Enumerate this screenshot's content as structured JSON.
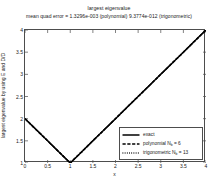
{
  "figure": {
    "title": "largest eigenvalue",
    "subtitle": "mean quad error = 1.3296e-003 (polynomial) 9.3774e-012 (trigonometric)",
    "xlabel": "x",
    "ylabel": "largest eigenvalue by using E and D/D"
  },
  "axes": {
    "xticks": [
      "0",
      "0.5",
      "1",
      "1.5",
      "2",
      "2.5",
      "3",
      "3.5",
      "4"
    ],
    "yticks": [
      "1",
      "1.5",
      "2",
      "2.5",
      "3",
      "3.5",
      "4"
    ]
  },
  "legend": {
    "items": [
      {
        "label": "exact",
        "label_sub": "",
        "label_tail": "",
        "style": "solid"
      },
      {
        "label": "polynomial N",
        "label_sub": "b",
        "label_tail": " = 6",
        "style": "dashed"
      },
      {
        "label": "trigonometric N",
        "label_sub": "b",
        "label_tail": " = 13",
        "style": "dotted"
      }
    ]
  },
  "chart_data": {
    "type": "line",
    "title": "largest eigenvalue",
    "subtitle": "mean quad error = 1.3296e-003 (polynomial) 9.3774e-012 (trigonometric)",
    "xlabel": "x",
    "ylabel": "largest eigenvalue by using E and D/D",
    "xlim": [
      0,
      4
    ],
    "ylim": [
      1,
      4
    ],
    "xticks": [
      0,
      0.5,
      1,
      1.5,
      2,
      2.5,
      3,
      3.5,
      4
    ],
    "yticks": [
      1,
      1.5,
      2,
      2.5,
      3,
      3.5,
      4
    ],
    "grid": false,
    "legend_position": "lower right",
    "series": [
      {
        "name": "exact",
        "style": "solid",
        "color": "#000000",
        "x": [
          0,
          0.25,
          0.5,
          0.75,
          1,
          1.25,
          1.5,
          1.75,
          2,
          2.25,
          2.5,
          2.75,
          3,
          3.25,
          3.5,
          3.75,
          4
        ],
        "y": [
          2,
          1.75,
          1.5,
          1.25,
          1,
          1.25,
          1.5,
          1.75,
          2,
          2.25,
          2.5,
          2.75,
          3,
          3.25,
          3.5,
          3.75,
          4
        ]
      },
      {
        "name": "polynomial Nb = 6",
        "style": "dashed",
        "color": "#000000",
        "x": [
          0,
          0.25,
          0.5,
          0.75,
          1,
          1.25,
          1.5,
          1.75,
          2,
          2.25,
          2.5,
          2.75,
          3,
          3.25,
          3.5,
          3.75,
          4
        ],
        "y": [
          2,
          1.75,
          1.5,
          1.25,
          1,
          1.25,
          1.5,
          1.75,
          2,
          2.25,
          2.5,
          2.75,
          3,
          3.25,
          3.5,
          3.75,
          4
        ]
      },
      {
        "name": "trigonometric Nb = 13",
        "style": "dotted",
        "color": "#000000",
        "x": [
          0,
          0.25,
          0.5,
          0.75,
          1,
          1.25,
          1.5,
          1.75,
          2,
          2.25,
          2.5,
          2.75,
          3,
          3.25,
          3.5,
          3.75,
          4
        ],
        "y": [
          2,
          1.75,
          1.5,
          1.25,
          1,
          1.25,
          1.5,
          1.75,
          2,
          2.25,
          2.5,
          2.75,
          3,
          3.25,
          3.5,
          3.75,
          4
        ]
      }
    ]
  }
}
